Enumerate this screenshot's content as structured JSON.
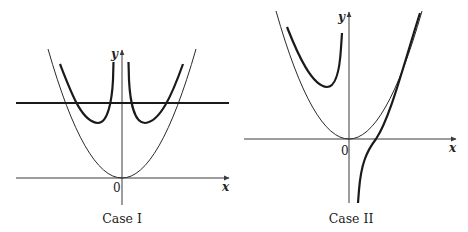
{
  "figure": {
    "panels": [
      {
        "id": "case-1",
        "caption": "Case I",
        "x_label": "x",
        "y_label": "y",
        "origin_label": "0",
        "curves": [
          {
            "name": "parabola",
            "style": "thin"
          },
          {
            "name": "left-branch",
            "style": "thick",
            "note": "asymptotic to y-axis from left"
          },
          {
            "name": "right-branch",
            "style": "thick",
            "note": "asymptotic to y-axis from right"
          },
          {
            "name": "horizontal-line",
            "style": "thick",
            "note": "horizontal line intersecting both branches twice"
          }
        ]
      },
      {
        "id": "case-2",
        "caption": "Case II",
        "x_label": "x",
        "y_label": "y",
        "origin_label": "0",
        "curves": [
          {
            "name": "parabola",
            "style": "thin"
          },
          {
            "name": "left-branch",
            "style": "thick",
            "note": "local minimum in second quadrant, rising toward y-axis"
          },
          {
            "name": "right-branch",
            "style": "thick",
            "note": "from below near y-axis, crossing x-axis, approaching parabola"
          }
        ]
      }
    ]
  }
}
